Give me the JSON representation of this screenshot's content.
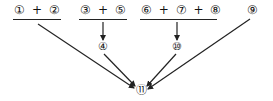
{
  "diagram": {
    "groups": [
      {
        "id": "g1",
        "label": "① + ②"
      },
      {
        "id": "g2",
        "label": "③ + ⑤"
      },
      {
        "id": "g3",
        "label": "⑥ + ⑦ + ⑧"
      }
    ],
    "nodes": {
      "n9": "⑨",
      "n4": "④",
      "n10": "⑩",
      "n11": "⑪"
    },
    "edges": [
      {
        "from": "① + ②",
        "to": "⑪"
      },
      {
        "from": "③ + ⑤",
        "to": "④"
      },
      {
        "from": "④",
        "to": "⑪"
      },
      {
        "from": "⑥ + ⑦ + ⑧",
        "to": "⑩"
      },
      {
        "from": "⑩",
        "to": "⑪"
      },
      {
        "from": "⑨",
        "to": "⑪"
      }
    ],
    "line_color": "#222222"
  }
}
